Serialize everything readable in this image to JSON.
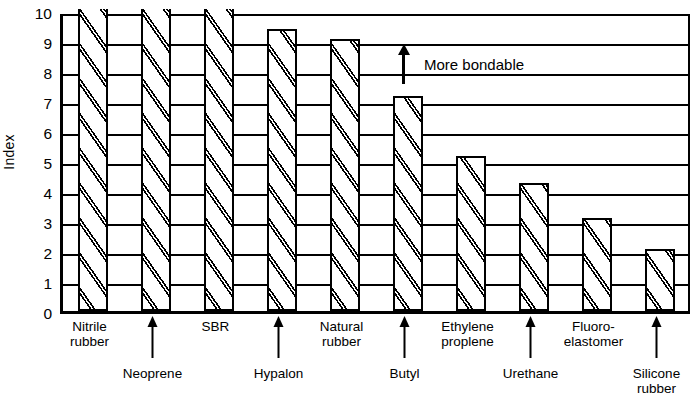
{
  "chart_data": {
    "type": "bar",
    "title": "",
    "xlabel": "",
    "ylabel": "Index",
    "ylim": [
      0,
      10
    ],
    "yticks": [
      0,
      1,
      2,
      3,
      4,
      5,
      6,
      7,
      8,
      9,
      10
    ],
    "grid": true,
    "legend": "none",
    "categories": [
      "Nitrile rubber",
      "Neoprene",
      "SBR",
      "Hypalon",
      "Natural rubber",
      "Butyl",
      "Ethylene proplene",
      "Urethane",
      "Fluoro-elastomer",
      "Silicone rubber"
    ],
    "values": [
      10,
      10,
      10,
      9.35,
      9.0,
      7.1,
      5.1,
      4.2,
      3.05,
      2.0
    ],
    "annotations": [
      {
        "text": "More bondable",
        "icon": "up-arrow-icon"
      }
    ]
  },
  "axis": {
    "y_title": "Index",
    "y_ticks": [
      "10",
      "9",
      "8",
      "7",
      "6",
      "5",
      "4",
      "3",
      "2",
      "1",
      "0"
    ]
  },
  "annotation": {
    "more_bondable": "More bondable"
  },
  "xlabels": [
    {
      "text": "Nitrile\nrubber",
      "row": 1
    },
    {
      "text": "Neoprene",
      "row": 2
    },
    {
      "text": "SBR",
      "row": 1
    },
    {
      "text": "Hypalon",
      "row": 2
    },
    {
      "text": "Natural\nrubber",
      "row": 1
    },
    {
      "text": "Butyl",
      "row": 2
    },
    {
      "text": "Ethylene\nproplene",
      "row": 1
    },
    {
      "text": "Urethane",
      "row": 2
    },
    {
      "text": "Fluoro-\nelastomer",
      "row": 1
    },
    {
      "text": "Silicone\nrubber",
      "row": 2
    }
  ],
  "style": {
    "ink": "#000000",
    "paper": "#ffffff"
  }
}
